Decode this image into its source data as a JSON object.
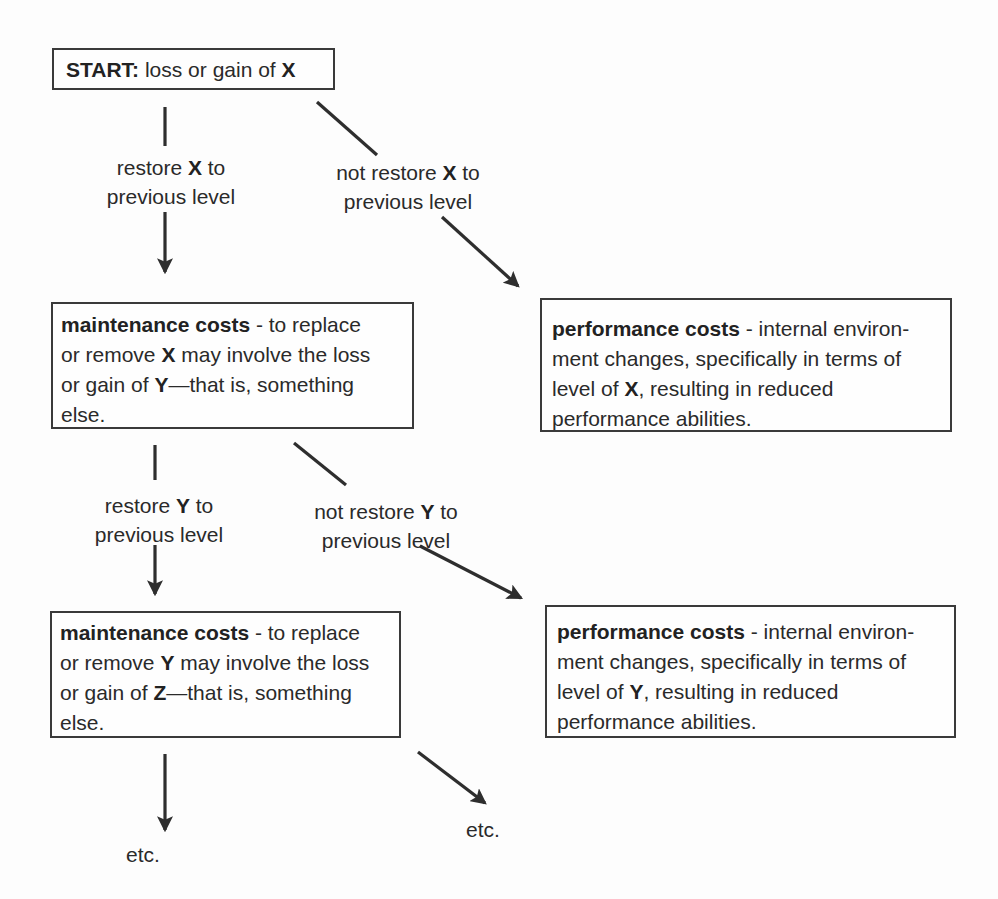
{
  "diagram": {
    "start": {
      "bold": "START:",
      "text": " loss or gain of ",
      "var": "X"
    },
    "branches": {
      "restore_x": {
        "line1_pre": "restore ",
        "line1_var": "X",
        "line1_post": " to",
        "line2": "previous level"
      },
      "not_restore_x": {
        "line1_pre": "not restore ",
        "line1_var": "X",
        "line1_post": " to",
        "line2": "previous level"
      },
      "restore_y": {
        "line1_pre": "restore ",
        "line1_var": "Y",
        "line1_post": " to",
        "line2": "previous level"
      },
      "not_restore_y": {
        "line1_pre": "not restore ",
        "line1_var": "Y",
        "line1_post": " to",
        "line2": "previous level"
      }
    },
    "maintenance_1": {
      "title": "maintenance costs",
      "l1": " - to replace",
      "l2_pre": "or remove ",
      "l2_var": "X",
      "l2_post": " may involve the loss",
      "l3_pre": "or gain of ",
      "l3_var": "Y",
      "l3_post": "—that is, something",
      "l4": "else."
    },
    "performance_1": {
      "title": "performance costs",
      "l1": " - internal environ-",
      "l2": "ment changes, specifically in terms of",
      "l3_pre": "level of ",
      "l3_var": "X",
      "l3_post": ", resulting in reduced",
      "l4": "performance abilities."
    },
    "maintenance_2": {
      "title": "maintenance costs",
      "l1": " - to replace",
      "l2_pre": "or remove ",
      "l2_var": "Y",
      "l2_post": " may involve the loss",
      "l3_pre": "or gain of ",
      "l3_var": "Z",
      "l3_post": "—that is, something",
      "l4": "else."
    },
    "performance_2": {
      "title": "performance costs",
      "l1": " - internal environ-",
      "l2": "ment changes, specifically in terms of",
      "l3_pre": "level of ",
      "l3_var": "Y",
      "l3_post": ", resulting in reduced",
      "l4": "performance abilities."
    },
    "etc_left": "etc.",
    "etc_right": "etc.",
    "colors": {
      "ink": "#2a2a2a",
      "border": "#3a3a3a",
      "background": "#fdfdfd"
    }
  }
}
